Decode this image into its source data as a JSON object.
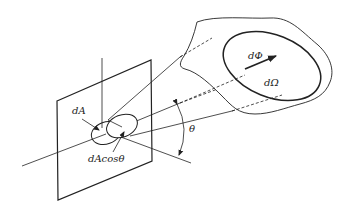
{
  "diagram": {
    "type": "radiometry-solid-angle",
    "labels": {
      "area": "dA",
      "projected_area": "dAcosθ",
      "flux": "dΦ",
      "solid_angle": "dΩ",
      "angle": "θ"
    },
    "elements": [
      "plane",
      "surface-normal",
      "incidence-axis",
      "area-ellipse",
      "projected-area-ellipse",
      "cone-of-rays",
      "irregular-surface",
      "solid-angle-ellipse",
      "flux-arrow",
      "angle-arc"
    ],
    "colors": {
      "stroke": "#222222",
      "background": "#ffffff"
    }
  }
}
